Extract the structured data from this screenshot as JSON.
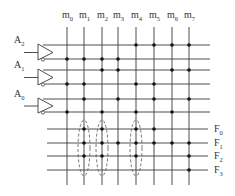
{
  "colors": {
    "wire": "#3a3a3a",
    "dot": "#111111",
    "ellipse": "#555555",
    "text": "#333333"
  },
  "columns": [
    {
      "name": "m",
      "sub": "0",
      "x": 67
    },
    {
      "name": "m",
      "sub": "1",
      "x": 84
    },
    {
      "name": "m",
      "sub": "2",
      "x": 102
    },
    {
      "name": "m",
      "sub": "3",
      "x": 118
    },
    {
      "name": "m",
      "sub": "4",
      "x": 136
    },
    {
      "name": "m",
      "sub": "5",
      "x": 154
    },
    {
      "name": "m",
      "sub": "6",
      "x": 172
    },
    {
      "name": "m",
      "sub": "7",
      "x": 189
    }
  ],
  "column_top": 27,
  "column_bottom": 185,
  "inputs": [
    {
      "name": "A",
      "sub": "2",
      "label_y": 44,
      "true_y": 45,
      "comp_y": 59,
      "true_dots": [
        4,
        5,
        6,
        7
      ],
      "comp_dots": [
        0,
        1,
        2,
        3
      ]
    },
    {
      "name": "A",
      "sub": "1",
      "label_y": 69,
      "true_y": 70,
      "comp_y": 84,
      "true_dots": [
        2,
        3,
        6,
        7
      ],
      "comp_dots": [
        0,
        1,
        4,
        5
      ]
    },
    {
      "name": "A",
      "sub": "0",
      "label_y": 98,
      "true_y": 99,
      "comp_y": 112,
      "true_dots": [
        1,
        3,
        5,
        7
      ],
      "comp_dots": [
        0,
        2,
        4,
        6
      ]
    }
  ],
  "input_line_start": 24,
  "buffer_left": 38,
  "buffer_tip": 53,
  "row_line_end": 210,
  "outputs": [
    {
      "name": "F",
      "sub": "0",
      "y": 129,
      "dots": [
        1,
        2,
        4,
        5
      ]
    },
    {
      "name": "F",
      "sub": "1",
      "y": 143,
      "dots": [
        1,
        2,
        3,
        4,
        5,
        6,
        7
      ]
    },
    {
      "name": "F",
      "sub": "2",
      "y": 156,
      "dots": [
        1,
        2,
        4,
        7
      ]
    },
    {
      "name": "F",
      "sub": "3",
      "y": 170,
      "dots": [
        7
      ]
    }
  ],
  "output_line_start": 47,
  "output_line_end": 208,
  "output_label_x": 214,
  "ellipses": [
    {
      "column": 1,
      "cy": 148,
      "rx": 6,
      "ry": 28
    },
    {
      "column": 2,
      "cy": 148,
      "rx": 6,
      "ry": 28
    },
    {
      "column": 4,
      "cy": 148,
      "rx": 6,
      "ry": 28
    }
  ]
}
